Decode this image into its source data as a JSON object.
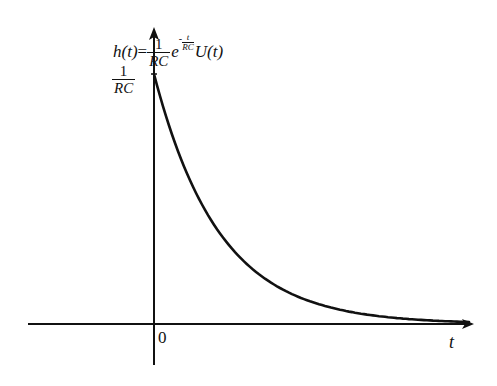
{
  "chart_data": {
    "type": "line",
    "formula": {
      "lhs": "h(t)",
      "eq": "=",
      "coef_num": "1",
      "coef_den": "RC",
      "base": "e",
      "exp_sign": "-",
      "exp_num": "t",
      "exp_den": "RC",
      "step": "U(t)"
    },
    "xlabel": "t",
    "ylabel": "h(t)",
    "origin_label": "0",
    "y_tick_label": {
      "num": "1",
      "den": "RC"
    },
    "series": [
      {
        "name": "h(t)",
        "description": "exponential decay starting at 1/RC at t=0, approaching 0 as t increases",
        "x": [
          0,
          0.5,
          1,
          1.5,
          2,
          2.5,
          3,
          3.5,
          4,
          4.5
        ],
        "values": [
          1.0,
          0.607,
          0.368,
          0.223,
          0.135,
          0.082,
          0.05,
          0.03,
          0.018,
          0.011
        ],
        "units": "multiples of 1/RC vs multiples of RC"
      }
    ],
    "xlim": [
      -1.9,
      4.8
    ],
    "ylim": [
      -0.15,
      1.2
    ],
    "grid": false,
    "legend": "none"
  },
  "colors": {
    "background": "#ffffff",
    "ink": "#111111"
  }
}
